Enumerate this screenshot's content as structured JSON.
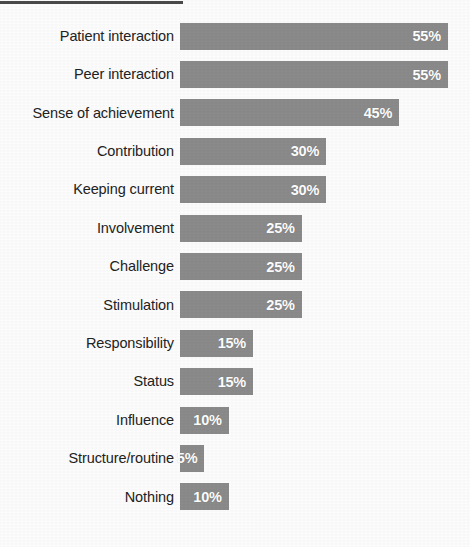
{
  "chart_data": {
    "type": "bar",
    "orientation": "horizontal",
    "title": "",
    "subtitle": "",
    "xlabel": "",
    "ylabel": "",
    "xlim": [
      0,
      60
    ],
    "grid": false,
    "legend": null,
    "value_suffix": "%",
    "bar_color": "#8b8b8b",
    "label_color": "#232323",
    "value_label_color": "#ffffff",
    "background_color": "#ffffff",
    "categories": [
      "Patient interaction",
      "Peer interaction",
      "Sense of achievement",
      "Contribution",
      "Keeping current",
      "Involvement",
      "Challenge",
      "Stimulation",
      "Responsibility",
      "Status",
      "Influence",
      "Structure/routine",
      "Nothing"
    ],
    "values": [
      55,
      55,
      45,
      30,
      30,
      25,
      25,
      25,
      15,
      15,
      10,
      5,
      10
    ],
    "value_labels": [
      "55%",
      "55%",
      "45%",
      "30%",
      "30%",
      "25%",
      "25%",
      "25%",
      "15%",
      "15%",
      "10%",
      "5%",
      "10%"
    ],
    "rows": [
      {
        "label": "Patient interaction",
        "value": 55,
        "value_label": "55%"
      },
      {
        "label": "Peer interaction",
        "value": 55,
        "value_label": "55%"
      },
      {
        "label": "Sense of achievement",
        "value": 45,
        "value_label": "45%"
      },
      {
        "label": "Contribution",
        "value": 30,
        "value_label": "30%"
      },
      {
        "label": "Keeping current",
        "value": 30,
        "value_label": "30%"
      },
      {
        "label": "Involvement",
        "value": 25,
        "value_label": "25%"
      },
      {
        "label": "Challenge",
        "value": 25,
        "value_label": "25%"
      },
      {
        "label": "Stimulation",
        "value": 25,
        "value_label": "25%"
      },
      {
        "label": "Responsibility",
        "value": 15,
        "value_label": "15%"
      },
      {
        "label": "Status",
        "value": 15,
        "value_label": "15%"
      },
      {
        "label": "Influence",
        "value": 10,
        "value_label": "10%"
      },
      {
        "label": "Structure/routine",
        "value": 5,
        "value_label": "5%"
      },
      {
        "label": "Nothing",
        "value": 10,
        "value_label": "10%"
      }
    ],
    "px_per_percent": 4.87
  }
}
